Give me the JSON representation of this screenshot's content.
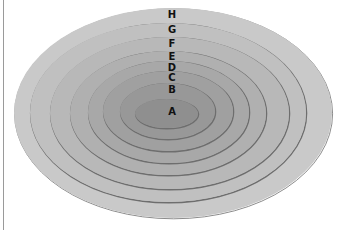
{
  "diagram": {
    "type": "nested-ellipses",
    "rings": [
      {
        "label": "H",
        "left": 14,
        "top": 8,
        "right": 332,
        "bottom": 218,
        "fill": "#c9c9c9",
        "label_y": 18
      },
      {
        "label": "G",
        "left": 30,
        "top": 23,
        "right": 306,
        "bottom": 202,
        "fill": "#c0c0c0",
        "label_y": 33
      },
      {
        "label": "F",
        "left": 50,
        "top": 37,
        "right": 289,
        "bottom": 189,
        "fill": "#b8b8b8",
        "label_y": 47
      },
      {
        "label": "E",
        "left": 70,
        "top": 51,
        "right": 266,
        "bottom": 175,
        "fill": "#b0b0b0",
        "label_y": 60
      },
      {
        "label": "D",
        "left": 88,
        "top": 61,
        "right": 249,
        "bottom": 163,
        "fill": "#a8a8a8",
        "label_y": 71
      },
      {
        "label": "C",
        "left": 103,
        "top": 71,
        "right": 233,
        "bottom": 151,
        "fill": "#a0a0a0",
        "label_y": 81
      },
      {
        "label": "B",
        "left": 120,
        "top": 83,
        "right": 215,
        "bottom": 139,
        "fill": "#989898",
        "label_y": 93
      },
      {
        "label": "A",
        "left": 135,
        "top": 99,
        "right": 198,
        "bottom": 128,
        "fill": "#8f8f8f",
        "label_y": 115
      }
    ],
    "label_x": 172,
    "stroke_color": "#6e6e6e",
    "left_rule_color": "#9a9a9a"
  }
}
